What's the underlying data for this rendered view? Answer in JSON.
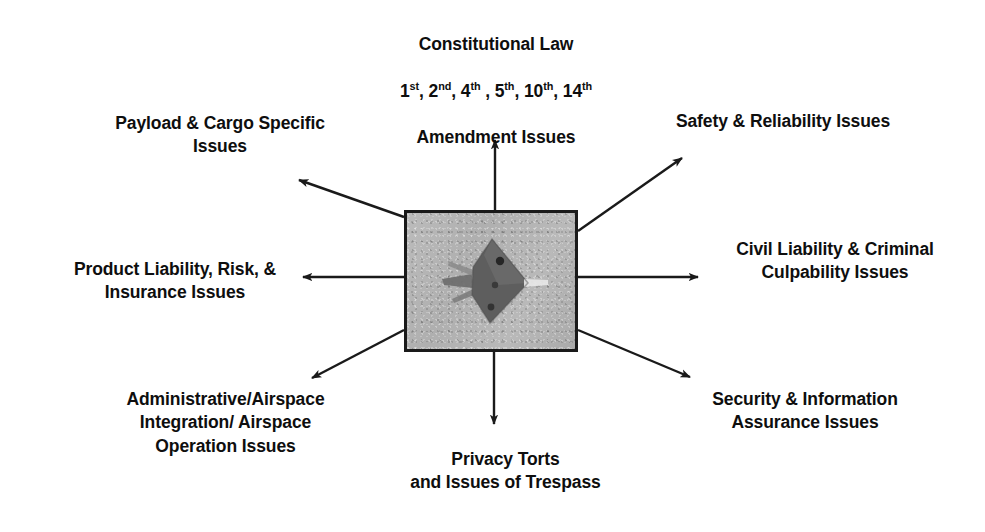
{
  "diagram": {
    "center": {
      "image_alt": "unmanned-aircraft-photo",
      "subject": "unmanned aerial vehicle seen from above",
      "border_color": "#1a1a1a",
      "fill_color": "#b4b4b4"
    },
    "arrow_color": "#1a1a1a",
    "text_color": "#0e0e0e",
    "branches": [
      {
        "id": "top",
        "direction": "up",
        "lines": [
          "Constitutional Law",
          "AMENDMENTS_LINE",
          "Amendment Issues"
        ],
        "line1": "Constitutional Law",
        "amendments": [
          "1",
          "2",
          "4",
          "5",
          "10",
          "14"
        ],
        "amendment_ordinals": [
          "st",
          "nd",
          "th",
          "th",
          "th",
          "th"
        ],
        "amendments_text": "1st, 2nd, 4th , 5th, 10th, 14th",
        "line3": "Amendment Issues"
      },
      {
        "id": "top-left",
        "direction": "up-left",
        "text": "Payload & Cargo Specific\nIssues"
      },
      {
        "id": "top-right",
        "direction": "up-right",
        "text": "Safety & Reliability Issues"
      },
      {
        "id": "left",
        "direction": "left",
        "text": "Product Liability, Risk, &\nInsurance Issues"
      },
      {
        "id": "right",
        "direction": "right",
        "text": "Civil Liability & Criminal\nCulpability Issues"
      },
      {
        "id": "bottom-left",
        "direction": "down-left",
        "text": "Administrative/Airspace\nIntegration/ Airspace\nOperation Issues"
      },
      {
        "id": "bottom",
        "direction": "down",
        "text": "Privacy Torts\nand Issues of Trespass"
      },
      {
        "id": "bottom-right",
        "direction": "down-right",
        "text": "Security & Information\nAssurance Issues"
      }
    ]
  }
}
